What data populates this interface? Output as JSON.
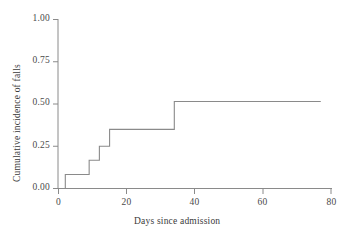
{
  "chart_data": {
    "type": "line",
    "subtype": "step-post",
    "title": "",
    "xlabel": "Days since admission",
    "ylabel": "Cumulative incidence of falls",
    "xlim": [
      0,
      80
    ],
    "ylim": [
      0.0,
      1.0
    ],
    "xticks": [
      0,
      20,
      40,
      60,
      80
    ],
    "xticklabels": [
      "0",
      "20",
      "40",
      "60",
      "80"
    ],
    "yticks": [
      0.0,
      0.25,
      0.5,
      0.75,
      1.0
    ],
    "yticklabels": [
      "0.00",
      "0.25",
      "0.50",
      "0.75",
      "1.00"
    ],
    "grid": false,
    "legend": null,
    "series": [
      {
        "name": "Cumulative incidence of falls",
        "color": "#8a8a8a",
        "x": [
          0,
          2,
          2,
          9,
          9,
          12,
          12,
          15,
          15,
          34,
          34,
          77
        ],
        "y": [
          0.0,
          0.0,
          0.083,
          0.083,
          0.167,
          0.167,
          0.25,
          0.25,
          0.35,
          0.35,
          0.515,
          0.515
        ],
        "steps": [
          {
            "day": 0,
            "value": 0.0
          },
          {
            "day": 2,
            "value": 0.083
          },
          {
            "day": 9,
            "value": 0.167
          },
          {
            "day": 12,
            "value": 0.25
          },
          {
            "day": 15,
            "value": 0.35
          },
          {
            "day": 34,
            "value": 0.515
          },
          {
            "day": 77,
            "value": 0.515
          }
        ]
      }
    ]
  },
  "axes": {
    "x_title": "Days since admission",
    "y_title": "Cumulative incidence of falls",
    "x_tick_labels": [
      "0",
      "20",
      "40",
      "60",
      "80"
    ],
    "y_tick_labels": [
      "0.00",
      "0.25",
      "0.50",
      "0.75",
      "1.00"
    ]
  },
  "colors": {
    "line": "#8a8a8a",
    "axis": "#8a8a8a",
    "text": "#3a3a3a",
    "background": "#ffffff"
  }
}
